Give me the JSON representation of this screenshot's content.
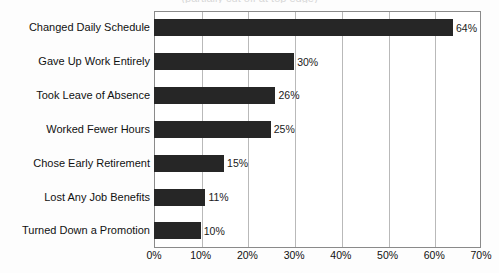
{
  "chart_data": {
    "type": "bar",
    "orientation": "horizontal",
    "title": "(partially cut off at top edge)",
    "categories": [
      "Changed Daily Schedule",
      "Gave Up Work Entirely",
      "Took Leave of Absence",
      "Worked Fewer Hours",
      "Chose Early Retirement",
      "Lost Any Job Benefits",
      "Turned Down a Promotion"
    ],
    "values": [
      64,
      30,
      26,
      25,
      15,
      11,
      10
    ],
    "value_labels": [
      "64%",
      "30%",
      "26%",
      "25%",
      "15%",
      "11%",
      "10%"
    ],
    "xlabel": "",
    "ylabel": "",
    "xlim": [
      0,
      70
    ],
    "xticks": [
      0,
      10,
      20,
      30,
      40,
      50,
      60,
      70
    ],
    "xtick_labels": [
      "0%",
      "10%",
      "20%",
      "30%",
      "40%",
      "50%",
      "60%",
      "70%"
    ],
    "grid": "vertical",
    "legend": "none",
    "bar_color": "#262626",
    "plot_background": "#ffffff",
    "gridline_color": "#b9b9b9",
    "axis_color": "#8a8a8a"
  }
}
